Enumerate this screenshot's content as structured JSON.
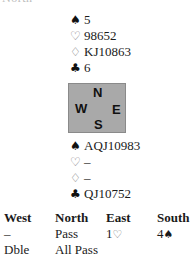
{
  "clipped_heading": "North",
  "north_hand": {
    "spades": {
      "symbol": "♠",
      "cards": "5"
    },
    "hearts": {
      "symbol": "♡",
      "cards": "98652"
    },
    "diamonds": {
      "symbol": "♢",
      "cards": "KJ10863"
    },
    "clubs": {
      "symbol": "♣",
      "cards": "6"
    }
  },
  "compass": {
    "north": "N",
    "west": "W",
    "east": "E",
    "south": "S",
    "box_color": "#a9a9a9"
  },
  "south_hand": {
    "spades": {
      "symbol": "♠",
      "cards": "AQJ10983"
    },
    "hearts": {
      "symbol": "♡",
      "cards": "–"
    },
    "diamonds": {
      "symbol": "♢",
      "cards": "–"
    },
    "clubs": {
      "symbol": "♣",
      "cards": "QJ10752"
    }
  },
  "auction": {
    "headers": [
      "West",
      "North",
      "East",
      "South"
    ],
    "rounds": [
      [
        {
          "text": "–"
        },
        {
          "text": "Pass"
        },
        {
          "text": "1",
          "suit": "♡"
        },
        {
          "text": "4",
          "suit": "♠"
        }
      ],
      [
        {
          "text": "Dble"
        },
        {
          "text": "All Pass"
        }
      ]
    ]
  }
}
